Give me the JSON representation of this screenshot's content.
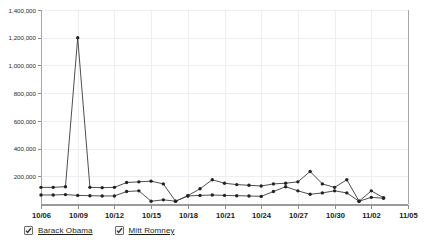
{
  "legend": {
    "items": [
      {
        "label": "Barack Obama",
        "checked": true,
        "color": "#3b3b3b",
        "icon": "checkbox-checked-icon"
      },
      {
        "label": "Mitt Romney",
        "checked": true,
        "color": "#3b3b3b",
        "icon": "checkbox-checked-icon"
      }
    ]
  },
  "chart_data": {
    "type": "line",
    "title": "",
    "xlabel": "",
    "ylabel": "",
    "grid": true,
    "legend_position": "bottom-left",
    "ylim": [
      0,
      1400000
    ],
    "ytick_labels": [
      "1,400,000",
      "1,200,000",
      "1,000,000",
      "800,000",
      "600,000",
      "400,000",
      "200,000"
    ],
    "ytick_values": [
      1400000,
      1200000,
      1000000,
      800000,
      600000,
      400000,
      200000
    ],
    "xtick_labels": [
      "10/06",
      "10/09",
      "10/12",
      "10/15",
      "10/18",
      "10/21",
      "10/24",
      "10/27",
      "10/30",
      "11/02",
      "11/05"
    ],
    "x": [
      "10/06",
      "10/07",
      "10/08",
      "10/09",
      "10/10",
      "10/11",
      "10/12",
      "10/13",
      "10/14",
      "10/15",
      "10/16",
      "10/17",
      "10/18",
      "10/19",
      "10/20",
      "10/21",
      "10/22",
      "10/23",
      "10/24",
      "10/25",
      "10/26",
      "10/27",
      "10/28",
      "10/29",
      "10/30",
      "10/31",
      "11/01",
      "11/02",
      "11/03"
    ],
    "series": [
      {
        "name": "Barack Obama",
        "values": [
          120000,
          120000,
          125000,
          1200000,
          120000,
          118000,
          120000,
          155000,
          160000,
          165000,
          145000,
          20000,
          60000,
          110000,
          175000,
          150000,
          140000,
          135000,
          130000,
          145000,
          150000,
          160000,
          235000,
          145000,
          120000,
          175000,
          20000,
          95000,
          45000
        ]
      },
      {
        "name": "Mitt Romney",
        "values": [
          65000,
          65000,
          68000,
          62000,
          60000,
          58000,
          58000,
          90000,
          95000,
          20000,
          30000,
          20000,
          58000,
          62000,
          65000,
          62000,
          60000,
          58000,
          55000,
          90000,
          125000,
          95000,
          70000,
          80000,
          95000,
          80000,
          20000,
          48000,
          42000
        ]
      }
    ]
  }
}
